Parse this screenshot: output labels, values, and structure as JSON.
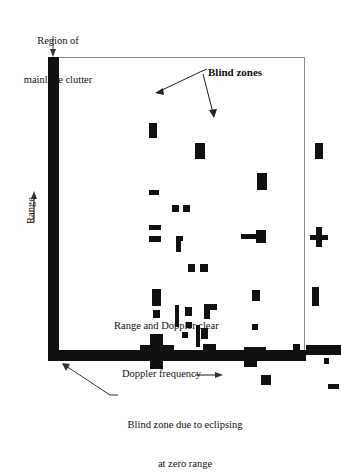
{
  "figure": {
    "labels": {
      "clutter_line1": "Region of",
      "clutter_line2": "mainlobe clutter",
      "blind_zones": "Blind zones",
      "range_doppler_clear": "Range and Doppler clear",
      "doppler_frequency": "Doppler frequency",
      "eclipse_line1": "Blind zone due to eclipsing",
      "eclipse_line2": "at zero range",
      "range_axis": "Range"
    },
    "colors": {
      "ink": "#111111",
      "frame": "#8d8d8d",
      "background": "#ffffff"
    },
    "axes": {
      "x_axis_label": "Doppler frequency",
      "y_axis_label": "Range",
      "x_arrow_direction": "right",
      "y_arrow_direction": "up"
    }
  },
  "chart_data": {
    "type": "scatter",
    "title": "",
    "xlabel": "Doppler frequency",
    "ylabel": "Range",
    "grid": false,
    "legend": "none",
    "xlim": [
      0,
      257
    ],
    "ylim": [
      0,
      297
    ],
    "annotations": [
      {
        "text": "Region of mainlobe clutter",
        "target": "left-clutter-band"
      },
      {
        "text": "Blind zones",
        "target": "two-blocks"
      },
      {
        "text": "Range and Doppler clear",
        "target": "open-area"
      },
      {
        "text": "Blind zone due to eclipsing at zero range",
        "target": "bottom-band"
      }
    ],
    "bands": [
      {
        "name": "mainlobe-clutter",
        "orientation": "vertical",
        "x": 0,
        "width": 11,
        "y": 0,
        "height": 304
      },
      {
        "name": "zero-range-eclipsing",
        "orientation": "horizontal",
        "x": 0,
        "width": 258,
        "y": 293,
        "height": 11
      }
    ],
    "blocks": [
      {
        "x": 101,
        "y": 66,
        "w": 8,
        "h": 15
      },
      {
        "x": 147,
        "y": 86,
        "w": 10,
        "h": 16
      },
      {
        "x": 209,
        "y": 116,
        "w": 10,
        "h": 17
      },
      {
        "x": 267,
        "y": 86,
        "w": 8,
        "h": 16
      },
      {
        "x": 101,
        "y": 133,
        "w": 10,
        "h": 5
      },
      {
        "x": 124,
        "y": 148,
        "w": 7,
        "h": 7
      },
      {
        "x": 135,
        "y": 148,
        "w": 7,
        "h": 7
      },
      {
        "x": 101,
        "y": 168,
        "w": 12,
        "h": 5
      },
      {
        "x": 101,
        "y": 179,
        "w": 12,
        "h": 6
      },
      {
        "x": 128,
        "y": 179,
        "w": 7,
        "h": 5
      },
      {
        "x": 128,
        "y": 179,
        "w": 5,
        "h": 16
      },
      {
        "x": 193,
        "y": 177,
        "w": 20,
        "h": 5
      },
      {
        "x": 208,
        "y": 173,
        "w": 10,
        "h": 13
      },
      {
        "x": 262,
        "y": 178,
        "w": 18,
        "h": 5
      },
      {
        "x": 268,
        "y": 170,
        "w": 6,
        "h": 20
      },
      {
        "x": 140,
        "y": 207,
        "w": 7,
        "h": 8
      },
      {
        "x": 152,
        "y": 207,
        "w": 8,
        "h": 8
      },
      {
        "x": 104,
        "y": 232,
        "w": 9,
        "h": 17
      },
      {
        "x": 105,
        "y": 253,
        "w": 7,
        "h": 8
      },
      {
        "x": 204,
        "y": 233,
        "w": 8,
        "h": 11
      },
      {
        "x": 264,
        "y": 230,
        "w": 7,
        "h": 19
      },
      {
        "x": 127,
        "y": 248,
        "w": 4,
        "h": 22
      },
      {
        "x": 137,
        "y": 250,
        "w": 7,
        "h": 9
      },
      {
        "x": 156,
        "y": 247,
        "w": 13,
        "h": 6
      },
      {
        "x": 156,
        "y": 247,
        "w": 6,
        "h": 15
      },
      {
        "x": 138,
        "y": 265,
        "w": 6,
        "h": 6
      },
      {
        "x": 134,
        "y": 275,
        "w": 6,
        "h": 6
      },
      {
        "x": 148,
        "y": 268,
        "w": 4,
        "h": 22
      },
      {
        "x": 153,
        "y": 271,
        "w": 7,
        "h": 11
      },
      {
        "x": 204,
        "y": 267,
        "w": 6,
        "h": 6
      },
      {
        "x": 155,
        "y": 287,
        "w": 13,
        "h": 6
      },
      {
        "x": 155,
        "y": 287,
        "w": 6,
        "h": 12
      },
      {
        "x": 92,
        "y": 288,
        "w": 34,
        "h": 13
      },
      {
        "x": 102,
        "y": 277,
        "w": 13,
        "h": 35
      },
      {
        "x": 196,
        "y": 290,
        "w": 22,
        "h": 12
      },
      {
        "x": 196,
        "y": 290,
        "w": 13,
        "h": 20
      },
      {
        "x": 245,
        "y": 287,
        "w": 7,
        "h": 6
      },
      {
        "x": 258,
        "y": 288,
        "w": 35,
        "h": 10
      },
      {
        "x": 276,
        "y": 301,
        "w": 5,
        "h": 6
      },
      {
        "x": 213,
        "y": 318,
        "w": 10,
        "h": 10
      },
      {
        "x": 280,
        "y": 327,
        "w": 11,
        "h": 5
      }
    ]
  }
}
